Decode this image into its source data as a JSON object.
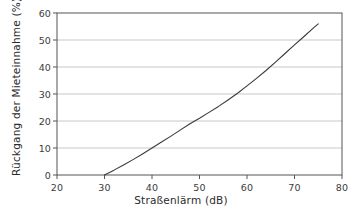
{
  "chart_data": {
    "type": "line",
    "title": "",
    "subtitle": "",
    "xlabel": "Straßenlärm (dB)",
    "ylabel": "Rückgang der Mieteinnahme (%)",
    "xlim": [
      20,
      80
    ],
    "ylim": [
      0,
      60
    ],
    "xticks": [
      20,
      30,
      40,
      50,
      60,
      70,
      80
    ],
    "xtick_labels": [
      "20",
      "30",
      "40",
      "50",
      "60",
      "70",
      "80"
    ],
    "yticks": [
      0,
      10,
      20,
      30,
      40,
      50,
      60
    ],
    "ytick_labels": [
      "0",
      "10",
      "20",
      "30",
      "40",
      "50",
      "60"
    ],
    "grid": {
      "horizontal": true,
      "vertical": false,
      "gridline_values": [
        10,
        20,
        30,
        40,
        50
      ],
      "color": "#c8c8c8"
    },
    "legend": {
      "visible": false,
      "position": "none",
      "entries": []
    },
    "annotations": [],
    "series": [
      {
        "name": "Rückgang der Mieteinnahme",
        "color": "#3a3a3a",
        "line_width": 1.1,
        "x": [
          30,
          32,
          34,
          36,
          38,
          40,
          42,
          44,
          46,
          48,
          50,
          52,
          54,
          56,
          58,
          60,
          62,
          64,
          66,
          68,
          70,
          72,
          74,
          75
        ],
        "values": [
          0,
          1.8,
          3.7,
          5.7,
          7.8,
          10,
          12.2,
          14.4,
          16.7,
          19,
          21,
          23.2,
          25.4,
          27.8,
          30.3,
          33,
          35.8,
          38.7,
          41.8,
          45,
          48.2,
          51.3,
          54.5,
          56
        ]
      }
    ],
    "axes_style": {
      "frame": true,
      "frame_color": "#555555",
      "background": "#ffffff"
    }
  }
}
